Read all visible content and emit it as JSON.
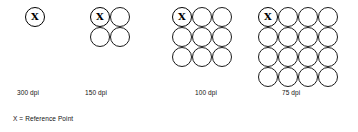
{
  "figure": {
    "background_color": "#ffffff",
    "stroke_color": "#1a1a1a",
    "text_color": "#111111",
    "reference_marker": "X",
    "legend": "X = Reference Point",
    "groups": [
      {
        "id": "group-300dpi",
        "label": "300 dpi",
        "dpi": 300,
        "columns": 1,
        "rows": 1,
        "dot_count": 1,
        "dot_diameter_px": 20,
        "reference_index": 0,
        "grid_left_px": 25,
        "label_left_px": 17
      },
      {
        "id": "group-150dpi",
        "label": "150 dpi",
        "dpi": 150,
        "columns": 2,
        "rows": 2,
        "dot_count": 4,
        "dot_diameter_px": 20,
        "reference_index": 0,
        "grid_left_px": 90,
        "label_left_px": 85
      },
      {
        "id": "group-100dpi",
        "label": "100 dpi",
        "dpi": 100,
        "columns": 3,
        "rows": 3,
        "dot_count": 9,
        "dot_diameter_px": 20,
        "reference_index": 0,
        "grid_left_px": 172,
        "label_left_px": 195
      },
      {
        "id": "group-75dpi",
        "label": "75 dpi",
        "dpi": 75,
        "columns": 4,
        "rows": 4,
        "dot_count": 16,
        "dot_diameter_px": 20,
        "reference_index": 0,
        "grid_left_px": 258,
        "label_left_px": 282
      }
    ]
  }
}
